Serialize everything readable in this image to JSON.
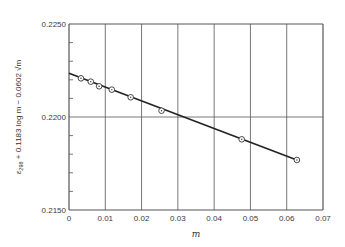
{
  "chart_data": {
    "type": "scatter",
    "title": "",
    "xlabel": "m",
    "ylabel": "ε298 + 0.1183 log m − 0.0602 √m",
    "ylabel_parts": {
      "eps": "ε",
      "sub": "298",
      "rest": " + 0.1183 log m − 0.0602 √m"
    },
    "xlim": [
      0,
      0.07
    ],
    "ylim": [
      0.215,
      0.225
    ],
    "x_ticks": [
      0,
      0.01,
      0.02,
      0.03,
      0.04,
      0.05,
      0.06,
      0.07
    ],
    "x_tick_labels": [
      "0",
      "0.01",
      "0.02",
      "0.03",
      "0.04",
      "0.05",
      "0.06",
      "0.07"
    ],
    "y_ticks": [
      0.215,
      0.22,
      0.225
    ],
    "y_tick_labels": [
      "0.2150",
      "0.2200",
      "0.2250"
    ],
    "y_minor_tick_step": 0.001,
    "grid": true,
    "legend": null,
    "series": [
      {
        "name": "measured",
        "marker": "circle-dot",
        "points": [
          {
            "x": 0.0033,
            "y": 0.22208
          },
          {
            "x": 0.006,
            "y": 0.2219
          },
          {
            "x": 0.0083,
            "y": 0.22165
          },
          {
            "x": 0.0118,
            "y": 0.22147
          },
          {
            "x": 0.017,
            "y": 0.22106
          },
          {
            "x": 0.0255,
            "y": 0.22034
          },
          {
            "x": 0.0476,
            "y": 0.2188
          },
          {
            "x": 0.0628,
            "y": 0.21769
          }
        ]
      },
      {
        "name": "fitted line",
        "type": "line",
        "points": [
          {
            "x": 0.0,
            "y": 0.22235
          },
          {
            "x": 0.0628,
            "y": 0.21769
          }
        ]
      }
    ]
  }
}
